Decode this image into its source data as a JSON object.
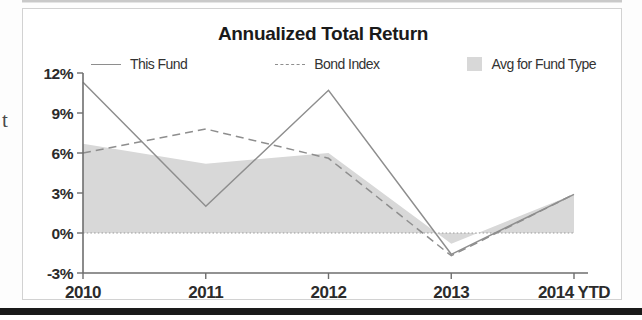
{
  "page": {
    "side_letter": "t"
  },
  "chart": {
    "title": "Annualized Total Return",
    "legend": [
      {
        "label": "This Fund",
        "marker": "solid-line-swatch",
        "color": "#8e8e8e"
      },
      {
        "label": "Bond Index",
        "marker": "dashed-line-swatch",
        "color": "#8e8e8e"
      },
      {
        "label": "Avg for Fund Type",
        "marker": "area-swatch",
        "color": "#d8d8d8"
      }
    ]
  },
  "chart_data": {
    "type": "line",
    "title": "Annualized Total Return",
    "xlabel": "",
    "ylabel": "",
    "categories": [
      "2010",
      "2011",
      "2012",
      "2013",
      "2014 YTD"
    ],
    "x_tick_labels": [
      "2010",
      "2011",
      "2012",
      "2013",
      "2014 YTD"
    ],
    "y_tick_labels": [
      "12%",
      "9%",
      "6%",
      "3%",
      "0%",
      "-3%"
    ],
    "y_ticks": [
      12,
      9,
      6,
      3,
      0,
      -3
    ],
    "ylim": [
      -3,
      12
    ],
    "grid": false,
    "zero_line": true,
    "legend_position": "top",
    "series": [
      {
        "name": "This Fund",
        "type": "line",
        "style": "solid",
        "color": "#8e8e8e",
        "values": [
          11.3,
          2.0,
          10.7,
          -1.6,
          2.9
        ]
      },
      {
        "name": "Bond Index",
        "type": "line",
        "style": "dashed",
        "color": "#8e8e8e",
        "values": [
          6.0,
          7.8,
          5.6,
          -1.7,
          2.9
        ]
      },
      {
        "name": "Avg for Fund Type",
        "type": "area",
        "style": "filled",
        "color": "#d8d8d8",
        "values": [
          6.7,
          5.2,
          6.0,
          -0.8,
          2.9
        ]
      }
    ]
  }
}
